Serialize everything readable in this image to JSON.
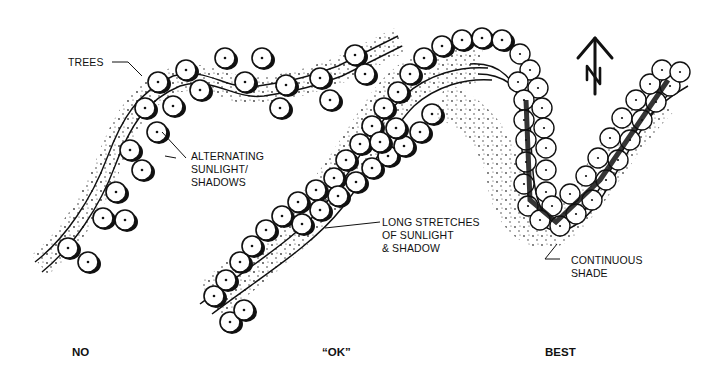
{
  "diagram": {
    "annotations": {
      "trees": "TREES",
      "alternating": [
        "ALTERNATING",
        "SUNLIGHT/",
        "SHADOWS"
      ],
      "long_stretches": [
        "LONG STRETCHES",
        "OF SUNLIGHT",
        "& SHADOW"
      ],
      "continuous": [
        "CONTINUOUS",
        "SHADE"
      ]
    },
    "captions": {
      "no": "NO",
      "ok": "“OK”",
      "best": "BEST"
    },
    "north_arrow": {
      "icon": "north-arrow-icon",
      "letter": "N"
    },
    "colors": {
      "ink": "#111111",
      "background": "#ffffff"
    }
  }
}
